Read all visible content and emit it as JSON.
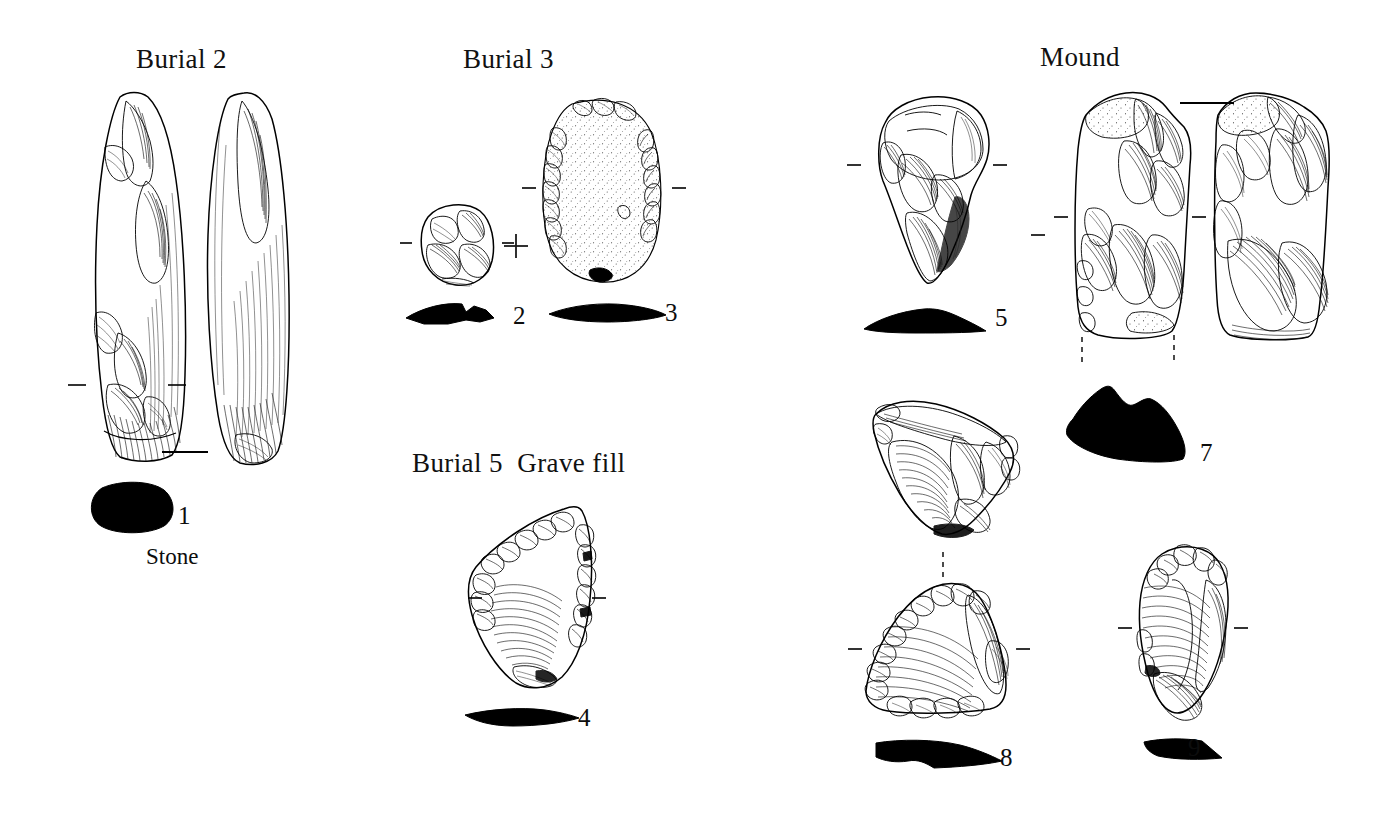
{
  "plate": {
    "background_color": "#ffffff",
    "ink_color": "#000000",
    "width": 1389,
    "height": 824,
    "description": "Plate of drawn stone artefacts grouped by archaeological context"
  },
  "groups": [
    {
      "id": "burial-2",
      "heading": "Burial 2"
    },
    {
      "id": "burial-3",
      "heading": "Burial 3"
    },
    {
      "id": "mound",
      "heading": "Mound"
    },
    {
      "id": "burial-5",
      "heading": "Burial 5  Grave fill"
    }
  ],
  "labels": {
    "stone": "Stone",
    "plus_symbol": "+"
  },
  "artefacts": [
    {
      "number": "1",
      "group": "burial-2",
      "views": 2,
      "type": "ground-stone-elongated-tool",
      "has_section": true
    },
    {
      "number": "2",
      "group": "burial-3",
      "views": 1,
      "type": "small-flaked-core",
      "has_section": true
    },
    {
      "number": "3",
      "group": "burial-3",
      "views": 1,
      "type": "oval-scraper",
      "has_section": true
    },
    {
      "number": "4",
      "group": "burial-5",
      "views": 1,
      "type": "retouched-flake",
      "has_section": true
    },
    {
      "number": "5",
      "group": "mound",
      "views": 1,
      "type": "pointed-flake-tool",
      "has_section": true
    },
    {
      "number": "7",
      "group": "mound",
      "views": 2,
      "type": "large-flake-core",
      "has_section": true
    },
    {
      "number": "8",
      "group": "mound",
      "views": 2,
      "type": "triangular-scraper",
      "has_section": true
    },
    {
      "number": "9",
      "group": "mound",
      "views": 1,
      "type": "elongated-blade-flake",
      "has_section": true
    }
  ]
}
